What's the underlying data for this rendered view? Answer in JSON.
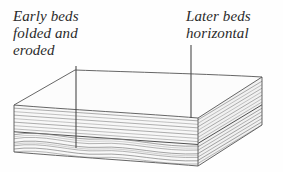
{
  "figure": {
    "kind": "geologic-block-diagram",
    "background_color": "#fefefe",
    "ink_color": "#4a4a4a",
    "line_color": "#555555",
    "top_face_color": "#fcfcfc",
    "front_face_color": "#f7f7f7",
    "side_face_color": "#f2f2f2",
    "strata_color": "#7a7a7a"
  },
  "captions": {
    "left": {
      "lines": [
        "Early beds",
        "folded and",
        "eroded"
      ],
      "text": "Early beds\nfolded and\neroded"
    },
    "right": {
      "lines": [
        "Later beds",
        "horizontal"
      ],
      "text": "Later beds\nhorizontal"
    },
    "top_cropped": ""
  },
  "leaders": [
    {
      "name": "leader-left",
      "x": 76,
      "y1": 66,
      "y2": 148
    },
    {
      "name": "leader-right",
      "x": 191,
      "y1": 45,
      "y2": 118
    }
  ],
  "block": {
    "front_top_left": [
      14,
      105
    ],
    "front_top_right": [
      198,
      118
    ],
    "front_bottom_left": [
      14,
      152
    ],
    "front_bottom_right": [
      198,
      166
    ],
    "back_top_left": [
      75,
      70
    ],
    "back_top_right": [
      262,
      77
    ],
    "back_bottom_right": [
      262,
      125
    ]
  },
  "strata": {
    "upper_unit": {
      "label": "Later beds horizontal",
      "style": "horizontal parallel layers",
      "count": 7,
      "top_y": 107,
      "bottom_y": 130
    },
    "unconformity_surface": {
      "label": "erosional unconformity",
      "y": 131,
      "emphasis": "heavier line"
    },
    "lower_unit": {
      "label": "Early beds folded and eroded",
      "style": "wavy folded layers truncated at top",
      "count": 7,
      "top_y": 133,
      "bottom_y": 154
    }
  }
}
